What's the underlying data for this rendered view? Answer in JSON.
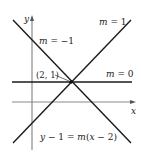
{
  "diagram": {
    "axes": {
      "x_label": "x",
      "y_label": "y"
    },
    "point": {
      "label": "(2, 1)"
    },
    "lines": [
      {
        "slope_label_var": "m",
        "slope_label_eq": " = 1",
        "slope": 1
      },
      {
        "slope_label_var": "m",
        "slope_label_eq": " = −1",
        "slope": -1
      },
      {
        "slope_label_var": "m",
        "slope_label_eq": " = 0",
        "slope": 0
      }
    ],
    "equation": {
      "y": "y",
      "mid": " − 1 = ",
      "m": "m",
      "paren_open": "(",
      "x": "x",
      "tail": " − 2)"
    },
    "colors": {
      "line": "#1a1a1a",
      "axis": "#777777",
      "text": "#222222"
    }
  }
}
